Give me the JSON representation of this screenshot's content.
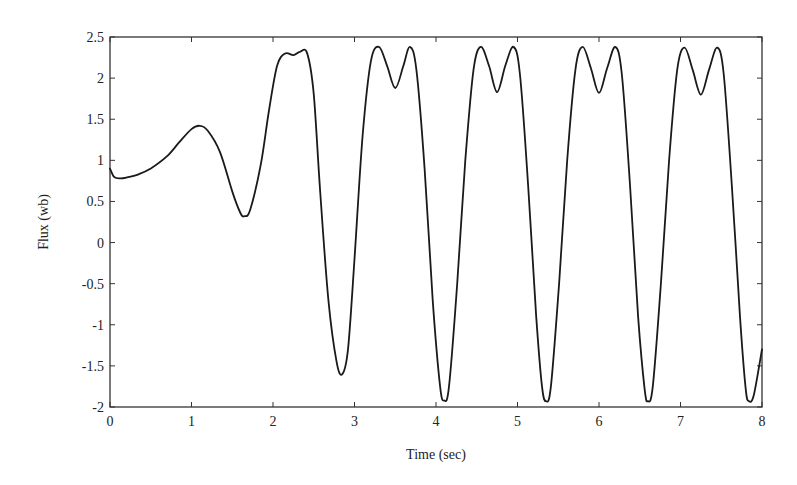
{
  "chart_data": {
    "type": "line",
    "title": "",
    "xlabel": "Time (sec)",
    "ylabel": "Flux (wb)",
    "xlim": [
      0,
      8
    ],
    "ylim": [
      -2,
      2.5
    ],
    "grid": false,
    "legend": null,
    "xticks": [
      0,
      1,
      2,
      3,
      4,
      5,
      6,
      7,
      8
    ],
    "xtick_labels": [
      "0",
      "1",
      "2",
      "3",
      "4",
      "5",
      "6",
      "7",
      "8"
    ],
    "yticks": [
      2.5,
      2,
      1.5,
      1,
      0.5,
      0,
      -0.5,
      -1,
      -1.5,
      -2
    ],
    "ytick_labels": [
      "2.5",
      "2",
      "1.5",
      "1",
      "0.5",
      "0",
      "-0.5",
      "-1",
      "-1.5",
      "-2"
    ],
    "series": [
      {
        "name": "Flux",
        "color": "#1a1a1a",
        "x": [
          0,
          0.05,
          0.12,
          0.2,
          0.35,
          0.5,
          0.7,
          0.85,
          1.0,
          1.1,
          1.2,
          1.35,
          1.5,
          1.6,
          1.65,
          1.72,
          1.85,
          1.95,
          2.05,
          2.15,
          2.25,
          2.33,
          2.42,
          2.5,
          2.58,
          2.68,
          2.78,
          2.85,
          2.92,
          3.0,
          3.1,
          3.2,
          3.3,
          3.4,
          3.5,
          3.6,
          3.68,
          3.76,
          3.86,
          3.96,
          4.05,
          4.1,
          4.16,
          4.26,
          4.36,
          4.46,
          4.55,
          4.65,
          4.75,
          4.85,
          4.95,
          5.03,
          5.13,
          5.23,
          5.3,
          5.35,
          5.41,
          5.51,
          5.61,
          5.71,
          5.8,
          5.9,
          6.0,
          6.1,
          6.2,
          6.28,
          6.38,
          6.48,
          6.56,
          6.6,
          6.66,
          6.76,
          6.86,
          6.96,
          7.05,
          7.15,
          7.25,
          7.35,
          7.45,
          7.53,
          7.63,
          7.73,
          7.8,
          7.84,
          7.9,
          8.0
        ],
        "y": [
          0.9,
          0.8,
          0.78,
          0.79,
          0.83,
          0.9,
          1.05,
          1.22,
          1.38,
          1.42,
          1.36,
          1.1,
          0.62,
          0.36,
          0.32,
          0.4,
          0.95,
          1.6,
          2.15,
          2.3,
          2.28,
          2.32,
          2.3,
          1.8,
          0.6,
          -0.7,
          -1.45,
          -1.6,
          -1.3,
          -0.2,
          1.3,
          2.2,
          2.38,
          2.15,
          1.88,
          2.15,
          2.38,
          2.1,
          0.9,
          -0.7,
          -1.75,
          -1.92,
          -1.75,
          -0.5,
          1.0,
          2.1,
          2.38,
          2.15,
          1.83,
          2.15,
          2.38,
          2.05,
          0.7,
          -0.9,
          -1.75,
          -1.93,
          -1.75,
          -0.5,
          1.0,
          2.1,
          2.38,
          2.12,
          1.82,
          2.12,
          2.38,
          2.05,
          0.7,
          -0.9,
          -1.78,
          -1.93,
          -1.75,
          -0.5,
          1.0,
          2.1,
          2.37,
          2.1,
          1.8,
          2.1,
          2.37,
          2.05,
          0.7,
          -0.9,
          -1.78,
          -1.93,
          -1.85,
          -1.3
        ]
      }
    ]
  }
}
